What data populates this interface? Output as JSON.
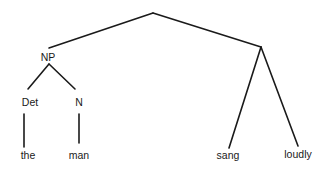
{
  "diagram": {
    "type": "syntax-tree",
    "nodes": [
      {
        "id": "root",
        "label": ""
      },
      {
        "id": "np",
        "label": "NP"
      },
      {
        "id": "vp",
        "label": ""
      },
      {
        "id": "det",
        "label": "Det"
      },
      {
        "id": "n",
        "label": "N"
      },
      {
        "id": "the",
        "label": "the"
      },
      {
        "id": "man",
        "label": "man"
      },
      {
        "id": "sang",
        "label": "sang"
      },
      {
        "id": "loudly",
        "label": "loudly"
      }
    ],
    "edges": [
      {
        "from": "root",
        "to": "np"
      },
      {
        "from": "root",
        "to": "vp"
      },
      {
        "from": "np",
        "to": "det"
      },
      {
        "from": "np",
        "to": "n"
      },
      {
        "from": "det",
        "to": "the"
      },
      {
        "from": "n",
        "to": "man"
      },
      {
        "from": "vp",
        "to": "sang"
      },
      {
        "from": "vp",
        "to": "loudly"
      }
    ],
    "labels": {
      "np": "NP",
      "det": "Det",
      "n": "N",
      "the": "the",
      "man": "man",
      "sang": "sang",
      "loudly": "loudly"
    }
  }
}
